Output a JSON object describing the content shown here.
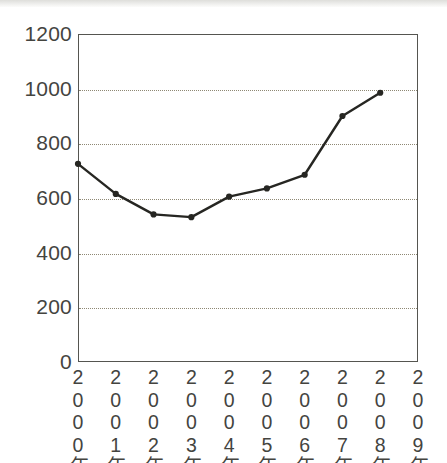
{
  "chart_data": {
    "type": "line",
    "title": "",
    "subtitle": "",
    "xlabel": "",
    "ylabel": "",
    "categories": [
      "2000年",
      "2001年",
      "2002年",
      "2003年",
      "2004年",
      "2005年",
      "2006年",
      "2007年",
      "2008年",
      "2009年"
    ],
    "series": [
      {
        "name": "",
        "values": [
          725,
          615,
          540,
          530,
          605,
          635,
          685,
          900,
          985,
          null
        ]
      }
    ],
    "ylim": [
      0,
      1200
    ],
    "yticks": [
      0,
      200,
      400,
      600,
      800,
      1000,
      1200
    ],
    "ytick_labels": [
      "0",
      "200",
      "400",
      "600",
      "800",
      "1000",
      "1200"
    ],
    "gridlines": {
      "horizontal": true,
      "horizontal_values": [
        200,
        400,
        600,
        800,
        1000
      ],
      "vertical": false,
      "style": "dotted",
      "color": "#8e8874"
    },
    "legend": {
      "visible": false,
      "position": "none",
      "entries": []
    },
    "marker": {
      "shape": "circle",
      "filled": true,
      "color": "#262622",
      "size": 5
    },
    "line": {
      "color": "#262622",
      "width": 2.4,
      "style": "solid"
    },
    "axis": {
      "frame": true,
      "frame_color": "#555550",
      "tick_marks": false
    },
    "background": "#ffffff"
  },
  "figure": {
    "axis_frame_name": "plot-frame",
    "y_axis_name": "y-axis",
    "x_axis_name": "x-axis"
  }
}
